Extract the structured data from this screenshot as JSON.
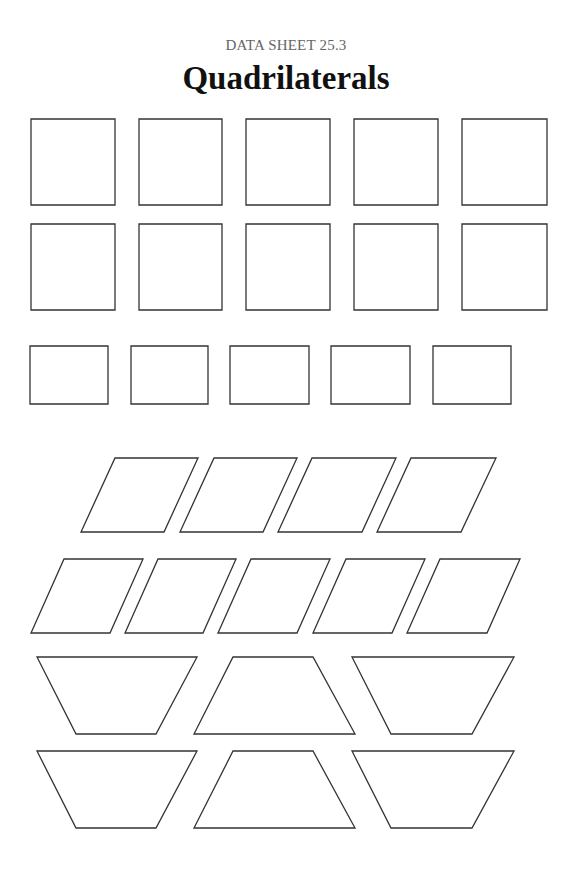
{
  "header": {
    "subtitle": "DATA SHEET 25.3",
    "title": "Quadrilaterals"
  },
  "style": {
    "stroke_color": "#333333",
    "title_color": "#111111",
    "subtitle_color": "#666666"
  },
  "shape_groups": [
    {
      "name": "squares-row-1",
      "type": "square",
      "shapes": [
        {
          "points": "31,119 115,119 115,205 31,205"
        },
        {
          "points": "139,119 222,119 222,205 139,205"
        },
        {
          "points": "246,119 330,119 330,205 246,205"
        },
        {
          "points": "354,119 438,119 438,205 354,205"
        },
        {
          "points": "462,119 547,119 547,205 462,205"
        }
      ]
    },
    {
      "name": "squares-row-2",
      "type": "square",
      "shapes": [
        {
          "points": "31,224 115,224 115,310 31,310"
        },
        {
          "points": "139,224 222,224 222,310 139,310"
        },
        {
          "points": "246,224 330,224 330,310 246,310"
        },
        {
          "points": "354,224 438,224 438,310 354,310"
        },
        {
          "points": "462,224 547,224 547,310 462,310"
        }
      ]
    },
    {
      "name": "rectangles-row",
      "type": "rectangle",
      "shapes": [
        {
          "points": "30,346 108,346 108,404 30,404"
        },
        {
          "points": "131,346 208,346 208,404 131,404"
        },
        {
          "points": "230,346 309,346 309,404 230,404"
        },
        {
          "points": "331,346 410,346 410,404 331,404"
        },
        {
          "points": "433,346 511,346 511,404 433,404"
        }
      ]
    },
    {
      "name": "parallelograms-row-1",
      "type": "parallelogram",
      "shapes": [
        {
          "points": "115,458 198,458 164,532 81,532"
        },
        {
          "points": "214,458 297,458 263,532 180,532"
        },
        {
          "points": "312,458 396,458 362,532 278,532"
        },
        {
          "points": "411,458 496,458 461,532 377,532"
        }
      ]
    },
    {
      "name": "parallelograms-row-2",
      "type": "parallelogram",
      "shapes": [
        {
          "points": "64,559 143,559 110,633 31,633"
        },
        {
          "points": "158,559 236,559 203,633 125,633"
        },
        {
          "points": "251,559 330,559 297,633 218,633"
        },
        {
          "points": "346,559 425,559 392,633 313,633"
        },
        {
          "points": "440,559 520,559 487,633 407,633"
        }
      ]
    },
    {
      "name": "trapezoids-row-1",
      "type": "trapezoid",
      "shapes": [
        {
          "points": "37,657 197,657 156,734 76,734"
        },
        {
          "points": "233,657 313,657 355,734 194,734"
        },
        {
          "points": "352,657 514,657 472,734 391,734"
        }
      ]
    },
    {
      "name": "trapezoids-row-2",
      "type": "trapezoid",
      "shapes": [
        {
          "points": "37,751 197,751 156,828 76,828"
        },
        {
          "points": "233,751 313,751 355,828 194,828"
        },
        {
          "points": "352,751 514,751 472,828 391,828"
        }
      ]
    }
  ]
}
